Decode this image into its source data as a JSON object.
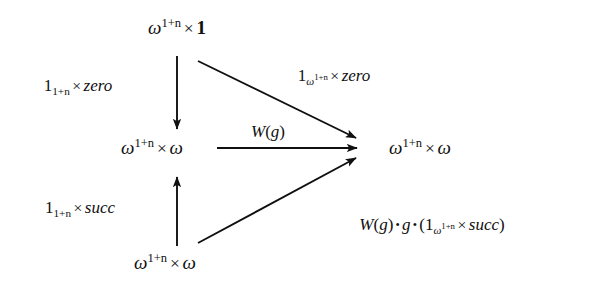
{
  "figure": {
    "kind": "commutative-diagram",
    "background_color": "#ffffff",
    "ink_color": "#101010"
  },
  "nodes": {
    "top": {
      "text": "ω^{1+n} × 1",
      "base": "ω",
      "exponent": "1+n",
      "operator": "×",
      "operand": "1"
    },
    "middle_left": {
      "text": "ω^{1+n} × ω",
      "base": "ω",
      "exponent": "1+n",
      "operator": "×",
      "operand": "ω"
    },
    "middle_right": {
      "text": "ω^{1+n} × ω",
      "base": "ω",
      "exponent": "1+n",
      "operator": "×",
      "operand": "ω"
    },
    "bottom": {
      "text": "ω^{1+n} × ω",
      "base": "ω",
      "exponent": "1+n",
      "operator": "×",
      "operand": "ω"
    }
  },
  "labels": {
    "left_top": {
      "text": "1_{1+n} × zero",
      "symbol": "1",
      "subscript": "1+n",
      "operator": "×",
      "morphism": "zero"
    },
    "left_bottom": {
      "text": "1_{1+n} × succ",
      "symbol": "1",
      "subscript": "1+n",
      "operator": "×",
      "morphism": "succ"
    },
    "diagonal_top": {
      "text": "1_{ω^{1+n}} × zero",
      "symbol": "1",
      "subscript_base": "ω",
      "subscript_exponent": "1+n",
      "operator": "×",
      "morphism": "zero"
    },
    "horizontal": {
      "text": "W(g)",
      "functor": "W",
      "open_paren": "(",
      "argument": "g",
      "close_paren": ")"
    },
    "diagonal_bottom": {
      "text": "W(g) • g • (1_{ω^{1+n}} × succ)",
      "functor": "W",
      "argument": "g",
      "compose": "•",
      "middle": "g",
      "symbol": "1",
      "subscript_base": "ω",
      "subscript_exponent": "1+n",
      "operator": "×",
      "morphism": "succ"
    }
  },
  "arrows": [
    {
      "name": "top-to-middle-left",
      "from": "top",
      "to": "middle_left",
      "direction": "down",
      "label": "left_top"
    },
    {
      "name": "bottom-to-middle-left",
      "from": "bottom",
      "to": "middle_left",
      "direction": "up",
      "label": "left_bottom"
    },
    {
      "name": "middle-left-to-middle-right",
      "from": "middle_left",
      "to": "middle_right",
      "direction": "right",
      "label": "horizontal"
    },
    {
      "name": "top-to-middle-right",
      "from": "top",
      "to": "middle_right",
      "direction": "diagonal-down-right",
      "label": "diagonal_top"
    },
    {
      "name": "bottom-to-middle-right",
      "from": "bottom",
      "to": "middle_right",
      "direction": "diagonal-up-right",
      "label": "diagonal_bottom"
    }
  ]
}
